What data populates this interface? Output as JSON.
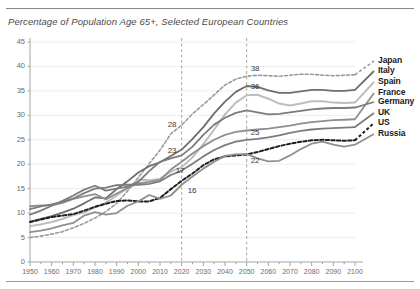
{
  "figure": {
    "title": "Percentage of Population Age 65+, Selected European Countries"
  },
  "chart_data": {
    "type": "line",
    "title": "Percentage of Population Age 65+, Selected European Countries",
    "xlabel": "",
    "ylabel": "",
    "xlim": [
      1950,
      2100
    ],
    "ylim": [
      0,
      45
    ],
    "ytick_labels": [
      "0",
      "5",
      "10",
      "15",
      "20",
      "25",
      "30",
      "35",
      "40",
      "45"
    ],
    "yticks": [
      0,
      5,
      10,
      15,
      20,
      25,
      30,
      35,
      40,
      45
    ],
    "xtick_labels": [
      "1950",
      "1960",
      "1970",
      "1980",
      "1990",
      "2000",
      "2010",
      "2020",
      "2030",
      "2040",
      "2050",
      "2060",
      "2070",
      "2080",
      "2090",
      "2100"
    ],
    "xticks": [
      1950,
      1960,
      1970,
      1980,
      1990,
      2000,
      2010,
      2020,
      2030,
      2040,
      2050,
      2060,
      2070,
      2080,
      2090,
      2100
    ],
    "minor_tick_interval": 5,
    "grid": "horizontal-light",
    "legend_position": "right",
    "reference_lines": [
      {
        "x": 2020,
        "style": "dashed"
      },
      {
        "x": 2050,
        "style": "dashed"
      }
    ],
    "annotations": [
      {
        "text": "38",
        "x": 2050,
        "y": 38,
        "series": "Japan"
      },
      {
        "text": "36",
        "x": 2050,
        "y": 36,
        "series": "Italy"
      },
      {
        "text": "28",
        "x": 2020,
        "y": 28,
        "series": "Japan"
      },
      {
        "text": "25",
        "x": 2050,
        "y": 25,
        "series": "UK"
      },
      {
        "text": "23",
        "x": 2020,
        "y": 23,
        "series": "Italy"
      },
      {
        "text": "22",
        "x": 2050,
        "y": 22,
        "series": "Russia"
      },
      {
        "text": "17",
        "x": 2020,
        "y": 17,
        "series": "US"
      },
      {
        "text": "16",
        "x": 2020,
        "y": 16,
        "series": "Russia"
      }
    ],
    "x": [
      1950,
      1955,
      1960,
      1965,
      1970,
      1975,
      1980,
      1985,
      1990,
      1995,
      2000,
      2005,
      2010,
      2015,
      2020,
      2025,
      2030,
      2035,
      2040,
      2045,
      2050,
      2055,
      2060,
      2065,
      2070,
      2075,
      2080,
      2085,
      2090,
      2095,
      2100
    ],
    "series": [
      {
        "name": "Japan",
        "color": "#9a9a9a",
        "style": "dashed",
        "width": 1.6,
        "values": [
          5.0,
          5.3,
          5.7,
          6.2,
          7.0,
          7.9,
          9.0,
          10.3,
          12.0,
          14.5,
          17.3,
          20.1,
          22.9,
          26.2,
          28.0,
          30.3,
          32.2,
          34.2,
          36.2,
          37.4,
          38.0,
          38.2,
          38.1,
          38.0,
          38.2,
          38.4,
          38.4,
          38.2,
          38.1,
          38.2,
          38.3
        ]
      },
      {
        "name": "Italy",
        "color": "#6e6e6e",
        "style": "solid",
        "width": 1.8,
        "values": [
          8.2,
          8.8,
          9.4,
          10.1,
          10.9,
          12.0,
          13.2,
          13.0,
          14.9,
          16.5,
          18.3,
          19.6,
          20.4,
          21.7,
          23.0,
          25.2,
          27.6,
          30.4,
          32.8,
          34.8,
          36.0,
          35.8,
          35.1,
          34.6,
          34.6,
          34.9,
          35.2,
          35.2,
          35.0,
          35.0,
          35.2
        ]
      },
      {
        "name": "Spain",
        "color": "#bdbdbd",
        "style": "solid",
        "width": 2.0,
        "values": [
          7.3,
          7.7,
          8.2,
          8.8,
          9.6,
          10.1,
          11.2,
          12.1,
          13.6,
          15.1,
          16.8,
          16.7,
          17.0,
          18.5,
          19.4,
          21.4,
          24.1,
          27.1,
          30.2,
          32.6,
          34.1,
          34.2,
          33.4,
          32.4,
          32.0,
          32.4,
          32.9,
          32.9,
          32.6,
          32.5,
          32.6
        ]
      },
      {
        "name": "France",
        "color": "#8f8f8f",
        "style": "solid",
        "width": 1.8,
        "values": [
          11.4,
          11.6,
          11.6,
          12.1,
          12.9,
          13.4,
          13.9,
          12.8,
          14.0,
          15.1,
          16.1,
          16.4,
          16.8,
          18.9,
          20.5,
          22.2,
          23.7,
          25.0,
          26.0,
          26.6,
          26.9,
          27.1,
          27.3,
          27.6,
          27.9,
          28.3,
          28.6,
          28.8,
          29.0,
          29.1,
          29.2
        ]
      },
      {
        "name": "Germany",
        "color": "#7c7c7c",
        "style": "solid",
        "width": 1.8,
        "values": [
          9.7,
          10.5,
          11.5,
          12.5,
          13.6,
          14.8,
          15.6,
          14.6,
          15.0,
          15.4,
          16.4,
          18.6,
          20.5,
          21.2,
          21.8,
          23.6,
          26.0,
          28.1,
          29.5,
          30.5,
          31.0,
          30.6,
          30.2,
          30.3,
          30.6,
          30.9,
          31.2,
          31.4,
          31.5,
          31.5,
          31.6
        ]
      },
      {
        "name": "UK",
        "color": "#7c7c7c",
        "style": "solid",
        "width": 1.8,
        "values": [
          10.8,
          11.4,
          11.8,
          12.3,
          13.0,
          14.1,
          15.0,
          15.2,
          15.7,
          15.8,
          15.8,
          16.0,
          16.5,
          17.8,
          18.7,
          20.1,
          21.6,
          22.9,
          23.9,
          24.6,
          25.0,
          25.2,
          25.5,
          25.9,
          26.4,
          26.8,
          27.1,
          27.3,
          27.4,
          27.5,
          27.6
        ]
      },
      {
        "name": "US",
        "color": "#1f1f1f",
        "style": "dashed",
        "width": 2.0,
        "values": [
          8.2,
          8.7,
          9.2,
          9.5,
          9.8,
          10.5,
          11.3,
          11.9,
          12.5,
          12.6,
          12.4,
          12.4,
          13.1,
          14.9,
          16.6,
          18.1,
          19.8,
          21.0,
          21.6,
          21.8,
          22.0,
          22.5,
          23.1,
          23.7,
          24.2,
          24.6,
          24.9,
          25.0,
          24.9,
          24.8,
          24.9
        ]
      },
      {
        "name": "Russia",
        "color": "#8f8f8f",
        "style": "solid",
        "width": 1.8,
        "values": [
          6.1,
          6.4,
          6.9,
          7.5,
          8.0,
          9.5,
          10.2,
          9.7,
          10.0,
          11.5,
          12.4,
          13.7,
          12.9,
          13.6,
          15.8,
          17.5,
          19.1,
          20.5,
          21.7,
          22.0,
          22.1,
          21.2,
          20.6,
          20.7,
          21.8,
          23.1,
          24.2,
          24.6,
          24.0,
          23.6,
          24.0
        ]
      }
    ]
  },
  "legend": {
    "items": [
      {
        "label": "Japan"
      },
      {
        "label": "Italy"
      },
      {
        "label": "Spain"
      },
      {
        "label": "France"
      },
      {
        "label": "Germany"
      },
      {
        "label": "UK"
      },
      {
        "label": "US"
      },
      {
        "label": "Russia"
      }
    ]
  }
}
